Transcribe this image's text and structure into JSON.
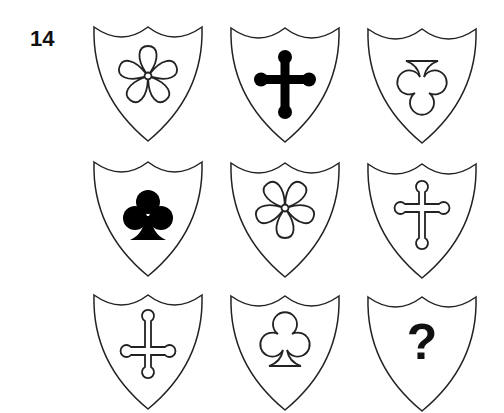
{
  "puzzle_number": "14",
  "grid": {
    "rows": 3,
    "cols": 3,
    "cells": [
      {
        "row": 0,
        "col": 0,
        "symbol": "five-petal-flower",
        "fill": "outline"
      },
      {
        "row": 0,
        "col": 1,
        "symbol": "budded-cross",
        "fill": "solid"
      },
      {
        "row": 0,
        "col": 2,
        "symbol": "club-inverted",
        "fill": "outline"
      },
      {
        "row": 1,
        "col": 0,
        "symbol": "club",
        "fill": "solid"
      },
      {
        "row": 1,
        "col": 1,
        "symbol": "five-petal-flower-inverted",
        "fill": "outline"
      },
      {
        "row": 1,
        "col": 2,
        "symbol": "budded-cross",
        "fill": "outline"
      },
      {
        "row": 2,
        "col": 0,
        "symbol": "budded-cross-inverted",
        "fill": "outline"
      },
      {
        "row": 2,
        "col": 1,
        "symbol": "club",
        "fill": "outline"
      },
      {
        "row": 2,
        "col": 2,
        "symbol": "question-mark",
        "fill": "solid"
      }
    ]
  },
  "missing_label": "?",
  "colors": {
    "stroke": "#222222",
    "fill": "#000000",
    "background": "#ffffff"
  }
}
